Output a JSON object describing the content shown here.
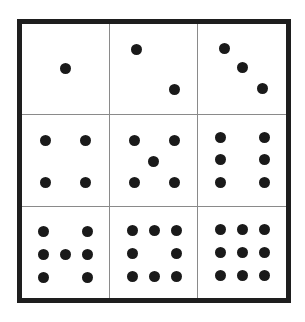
{
  "figure": {
    "colors": {
      "border": "#1e1e1e",
      "divider": "#8a8a8a",
      "dot": "#1a1a1a",
      "background": "#ffffff"
    },
    "frame": {
      "left": 17,
      "top": 19,
      "right": 291,
      "bottom": 303,
      "thickness": 5
    },
    "dividers": {
      "vertical_x": [
        109,
        197
      ],
      "horizontal_y": [
        114,
        206
      ]
    },
    "cells": [
      {
        "row": 0,
        "col": 0,
        "count": 1,
        "dots": [
          [
            65,
            68
          ]
        ]
      },
      {
        "row": 0,
        "col": 1,
        "count": 2,
        "dots": [
          [
            136,
            49
          ],
          [
            174,
            89
          ]
        ]
      },
      {
        "row": 0,
        "col": 2,
        "count": 3,
        "dots": [
          [
            224,
            48
          ],
          [
            242,
            67
          ],
          [
            262,
            88
          ]
        ]
      },
      {
        "row": 1,
        "col": 0,
        "count": 4,
        "dots": [
          [
            45,
            140
          ],
          [
            85,
            140
          ],
          [
            45,
            182
          ],
          [
            85,
            182
          ]
        ]
      },
      {
        "row": 1,
        "col": 1,
        "count": 5,
        "dots": [
          [
            134,
            140
          ],
          [
            174,
            140
          ],
          [
            153,
            161
          ],
          [
            134,
            182
          ],
          [
            174,
            182
          ]
        ]
      },
      {
        "row": 1,
        "col": 2,
        "count": 6,
        "dots": [
          [
            220,
            137
          ],
          [
            264,
            137
          ],
          [
            220,
            159
          ],
          [
            264,
            159
          ],
          [
            220,
            182
          ],
          [
            264,
            182
          ]
        ]
      },
      {
        "row": 2,
        "col": 0,
        "count": 7,
        "dots": [
          [
            43,
            231
          ],
          [
            87,
            231
          ],
          [
            43,
            254
          ],
          [
            65,
            254
          ],
          [
            87,
            254
          ],
          [
            43,
            277
          ],
          [
            87,
            277
          ]
        ]
      },
      {
        "row": 2,
        "col": 1,
        "count": 8,
        "dots": [
          [
            132,
            230
          ],
          [
            154,
            230
          ],
          [
            176,
            230
          ],
          [
            132,
            253
          ],
          [
            176,
            253
          ],
          [
            132,
            276
          ],
          [
            154,
            276
          ],
          [
            176,
            276
          ]
        ]
      },
      {
        "row": 2,
        "col": 2,
        "count": 9,
        "dots": [
          [
            220,
            229
          ],
          [
            242,
            229
          ],
          [
            264,
            229
          ],
          [
            220,
            252
          ],
          [
            242,
            252
          ],
          [
            264,
            252
          ],
          [
            220,
            275
          ],
          [
            242,
            275
          ],
          [
            264,
            275
          ]
        ]
      }
    ]
  }
}
